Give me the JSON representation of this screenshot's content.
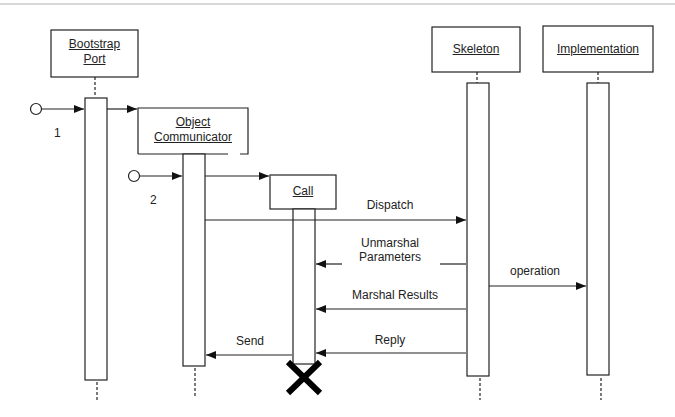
{
  "diagram": {
    "type": "sequence",
    "objects": [
      {
        "id": "bootstrap_port",
        "line1": "Bootstrap",
        "line2": "Port"
      },
      {
        "id": "object_communicator",
        "line1": "Object",
        "line2": "Communicator"
      },
      {
        "id": "call",
        "line1": "Call"
      },
      {
        "id": "skeleton",
        "line1": "Skeleton"
      },
      {
        "id": "implementation",
        "line1": "Implementation"
      }
    ],
    "start_points": [
      {
        "label": "1"
      },
      {
        "label": "2"
      }
    ],
    "messages": [
      {
        "label": "Dispatch",
        "from": "object_communicator",
        "to": "skeleton"
      },
      {
        "line1": "Unmarshal",
        "line2": "Parameters",
        "from": "skeleton",
        "to": "call"
      },
      {
        "label": "operation",
        "from": "skeleton",
        "to": "implementation"
      },
      {
        "label": "Marshal Results",
        "from": "skeleton",
        "to": "call"
      },
      {
        "label": "Reply",
        "from": "skeleton",
        "to": "call"
      },
      {
        "label": "Send",
        "from": "call",
        "to": "object_communicator"
      }
    ],
    "destroy_marker": "X"
  }
}
